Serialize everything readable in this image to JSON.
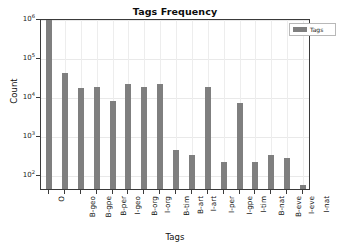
{
  "chart_data": {
    "type": "bar",
    "title": "Tags Frequency",
    "xlabel": "Tags",
    "ylabel": "Count",
    "yscale": "log",
    "ylim": [
      40,
      1000000
    ],
    "grid": true,
    "legend_position": "upper right",
    "legend": [
      "Tags"
    ],
    "bar_color": "#7f7f7f",
    "categories": [
      "O",
      "B-geo",
      "B-gpe",
      "B-per",
      "I-geo",
      "B-org",
      "I-org",
      "B-tim",
      "B-art",
      "I-art",
      "I-per",
      "I-gpe",
      "I-tim",
      "B-nat",
      "B-eve",
      "I-eve",
      "I-nat"
    ],
    "values": [
      887908,
      37644,
      15870,
      16990,
      7414,
      20143,
      16784,
      20333,
      402,
      297,
      17251,
      198,
      6528,
      201,
      308,
      253,
      51
    ],
    "ytick_labels": [
      "10^2",
      "10^3",
      "10^4",
      "10^5",
      "10^6"
    ],
    "ytick_values": [
      100,
      1000,
      10000,
      100000,
      1000000
    ],
    "series": [
      {
        "name": "Tags",
        "values": [
          887908,
          37644,
          15870,
          16990,
          7414,
          20143,
          16784,
          20333,
          402,
          297,
          17251,
          198,
          6528,
          201,
          308,
          253,
          51
        ]
      }
    ]
  },
  "legend": {
    "label": "Tags"
  },
  "axis": {
    "title": "Tags Frequency",
    "x_title": "Tags",
    "y_title": "Count"
  }
}
